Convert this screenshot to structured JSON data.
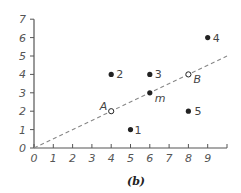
{
  "chart_data": {
    "type": "scatter",
    "title": "",
    "caption": "(b)",
    "xlabel": "",
    "ylabel": "",
    "xlim": [
      0,
      10
    ],
    "ylim": [
      0,
      7
    ],
    "grid": false,
    "x_ticks": [
      "0",
      "1",
      "2",
      "3",
      "4",
      "5",
      "6",
      "7",
      "8",
      "9",
      ""
    ],
    "y_ticks": [
      "0",
      "1",
      "2",
      "3",
      "4",
      "5",
      "6",
      "7"
    ],
    "series": [
      {
        "name": "numbered points",
        "marker": "filled-circle",
        "points": [
          {
            "label": "1",
            "x": 5,
            "y": 1
          },
          {
            "label": "2",
            "x": 4,
            "y": 4
          },
          {
            "label": "3",
            "x": 6,
            "y": 4
          },
          {
            "label": "4",
            "x": 9,
            "y": 6
          },
          {
            "label": "5",
            "x": 8,
            "y": 2
          }
        ]
      },
      {
        "name": "line points",
        "points": [
          {
            "label": "A",
            "x": 4,
            "y": 2,
            "marker": "hollow-circle"
          },
          {
            "label": "m",
            "x": 6,
            "y": 3,
            "marker": "filled-circle"
          },
          {
            "label": "B",
            "x": 8,
            "y": 4,
            "marker": "hollow-circle"
          }
        ]
      }
    ],
    "lines": [
      {
        "name": "dashed line",
        "style": "dashed",
        "from": [
          0,
          0
        ],
        "to": [
          10,
          5
        ],
        "equation": "y = x/2"
      }
    ]
  },
  "colors": {
    "axis": "#555555",
    "points": "#222222",
    "dashed_line": "#888888",
    "background": "#ffffff"
  }
}
